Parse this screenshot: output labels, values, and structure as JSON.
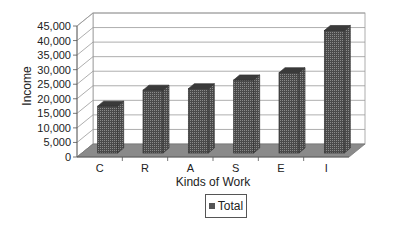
{
  "chart_data": {
    "type": "bar",
    "title": "",
    "xlabel": "Kinds of Work",
    "ylabel": "Income",
    "categories": [
      "C",
      "R",
      "A",
      "S",
      "E",
      "I"
    ],
    "series": [
      {
        "name": "Total",
        "values": [
          15000,
          20500,
          21000,
          24000,
          26500,
          41000
        ]
      }
    ],
    "ylim": [
      0,
      45000
    ],
    "yticks": [
      0,
      5000,
      10000,
      15000,
      20000,
      25000,
      30000,
      35000,
      40000,
      45000
    ],
    "ytick_labels": [
      "0",
      "5,000",
      "10,000",
      "15,000",
      "20,000",
      "25,000",
      "30,000",
      "35,000",
      "40,000",
      "45,000"
    ],
    "grid": true,
    "style": "3d-column",
    "legend_position": "bottom",
    "colors": {
      "bar": "#555555",
      "floor": "#8a8a8a",
      "grid": "#999999"
    }
  },
  "legend": {
    "label": "Total"
  }
}
